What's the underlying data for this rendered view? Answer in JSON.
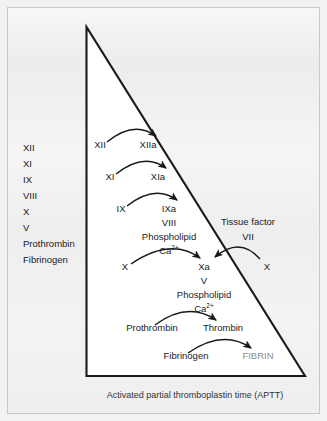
{
  "figure": {
    "caption": "Activated partial thromboplastin time (APTT)",
    "colors": {
      "background": "#eeeeee",
      "triangle_fill": "#ffffff",
      "triangle_stroke": "#1a1a1a",
      "text": "#1a1a1a",
      "fibrin_text": "#8f8f8f",
      "frame_border": "#c9c9c9"
    }
  },
  "factor_list": {
    "items": [
      "XII",
      "XI",
      "IX",
      "VIII",
      "X",
      "V",
      "Prothrombin",
      "Fibrinogen"
    ]
  },
  "cascade": {
    "step1": {
      "source": "XII",
      "product": "XIIa"
    },
    "step2": {
      "source": "XI",
      "product": "XIa"
    },
    "step3": {
      "source": "IX",
      "product": "IXa",
      "cofactor": "VIII",
      "phospholipid": "Phospholipid",
      "calcium": "Ca",
      "calcium_sup": "2+"
    },
    "step4": {
      "source": "X",
      "product": "Xa",
      "cofactor": "V",
      "phospholipid": "Phospholipid",
      "calcium": "Ca",
      "calcium_sup": "2+"
    },
    "step5": {
      "source": "Prothrombin",
      "product": "Thrombin"
    },
    "step6": {
      "source": "Fibrinogen",
      "product": "FIBRIN"
    },
    "extrinsic": {
      "title": "Tissue factor",
      "factor": "VII",
      "substrate": "X"
    }
  }
}
